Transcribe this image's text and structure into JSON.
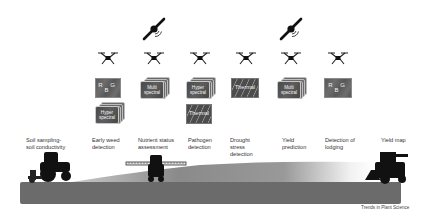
{
  "figure": {
    "source_credit": "Trends in Plant Science",
    "columns": [
      {
        "id": "soil",
        "label_line1": "Soil sampling-",
        "label_line2": "soil conductivity",
        "platform": "ground-tractor",
        "sensors": []
      },
      {
        "id": "weed",
        "label_line1": "Early weed",
        "label_line2": "detection",
        "platform": "drone",
        "sensors": [
          {
            "type": "RGB",
            "label": "R G B"
          },
          {
            "type": "Hyperspectral",
            "label_line1": "Hyper",
            "label_line2": "spectral"
          }
        ]
      },
      {
        "id": "nutrient",
        "label_line1": "Nutrient status",
        "label_line2": "assessment",
        "platform": "drone+satellite",
        "sensors": [
          {
            "type": "Multispectral",
            "label_line1": "Multi",
            "label_line2": "spectral"
          }
        ]
      },
      {
        "id": "pathogen",
        "label_line1": "Pathogen",
        "label_line2": "detection",
        "platform": "drone",
        "sensors": [
          {
            "type": "Hyperspectral",
            "label_line1": "Hyper",
            "label_line2": "spectral"
          },
          {
            "type": "Thermal",
            "label": "Thermal"
          }
        ]
      },
      {
        "id": "drought",
        "label_line1": "Drought",
        "label_line2": "stress",
        "label_line3": "detection",
        "platform": "drone",
        "sensors": [
          {
            "type": "Thermal",
            "label": "Thermal"
          }
        ]
      },
      {
        "id": "yield",
        "label_line1": "Yield",
        "label_line2": "prediction",
        "platform": "drone+satellite",
        "sensors": [
          {
            "type": "Multispectral",
            "label_line1": "Multi",
            "label_line2": "spectral"
          }
        ]
      },
      {
        "id": "lodging",
        "label_line1": "Detection of",
        "label_line2": "lodging",
        "platform": "drone",
        "sensors": [
          {
            "type": "RGB",
            "label": "R G B"
          }
        ]
      },
      {
        "id": "yieldmap",
        "label_line1": "Yield map",
        "platform": "ground-combine",
        "sensors": []
      }
    ],
    "icons": {
      "satellite": "satellite-icon",
      "drone": "drone-icon",
      "tractor": "tractor-icon",
      "sprayer": "sprayer-icon",
      "combine": "combine-harvester-icon"
    },
    "colors": {
      "soil": "#6b6b6b",
      "crop_dark": "#8c8c8c",
      "crop_light": "#e8e8e8",
      "vehicle": "#111111",
      "card_dark": "#555555",
      "text": "#333333"
    }
  }
}
